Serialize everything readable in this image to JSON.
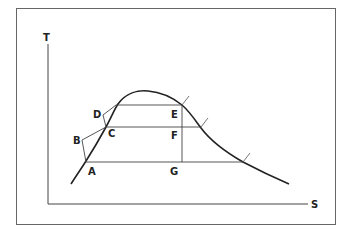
{
  "diagram": {
    "type": "temperature-entropy (T-S) diagram with saturation dome",
    "axes": {
      "y_label": "T",
      "x_label": "S"
    },
    "points": {
      "A": {
        "label": "A"
      },
      "B": {
        "label": "B"
      },
      "C": {
        "label": "C"
      },
      "D": {
        "label": "D"
      },
      "E": {
        "label": "E"
      },
      "F": {
        "label": "F"
      },
      "G": {
        "label": "G"
      }
    },
    "colors": {
      "line": "#222222",
      "frame": "#555555",
      "background": "#ffffff"
    }
  }
}
